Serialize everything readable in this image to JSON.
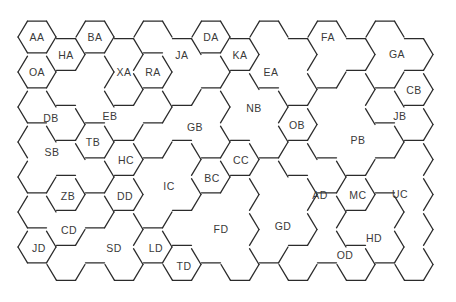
{
  "map": {
    "type": "hexagonal region map",
    "grid": {
      "origin_x": 37,
      "origin_y": 37,
      "col_step": 29,
      "row_step": 35,
      "hex_radius": 19,
      "odd_col_offset": 17.5
    },
    "line_color": "#2b2b2b",
    "cells": [
      [
        "AA",
        "OA",
        "DB",
        "SB",
        "SB",
        "CD",
        "JD"
      ],
      [
        "HA",
        "EB",
        "DB",
        "SB",
        "ZB",
        "CD",
        "SD"
      ],
      [
        "BA",
        "EB",
        "EB",
        "TB",
        "SB",
        "CD",
        "SD"
      ],
      [
        "XA",
        "XA",
        "EB",
        "HC",
        "DD",
        "SD",
        "SD"
      ],
      [
        "JA",
        "RA",
        "EB",
        "GB",
        "IC",
        "IC",
        "LD"
      ],
      [
        "JA",
        "JA",
        "GB",
        "IC",
        "IC",
        "FD",
        "TD"
      ],
      [
        "DA",
        "JA",
        "GB",
        "GB",
        "BC",
        "FD",
        "FD"
      ],
      [
        "KA",
        "NB",
        "NB",
        "CC",
        "FD",
        "FD",
        "FD"
      ],
      [
        "EA",
        "EA",
        "NB",
        "NB",
        "GD",
        "GD",
        "GD"
      ],
      [
        "EA",
        "EA",
        "OB",
        "AD",
        "GD",
        "GD",
        "OD"
      ],
      [
        "FA",
        "FA",
        "PB",
        "PB",
        "AD",
        "OD",
        "OD"
      ],
      [
        "FA",
        "PB",
        "PB",
        "PB",
        "MC",
        "HD",
        "OD"
      ],
      [
        "GA",
        "GA",
        "JB",
        "PB",
        "UC",
        "HD",
        "HD"
      ],
      [
        "GA",
        "CB",
        "JB",
        "UC",
        "UC",
        "UC",
        "UC"
      ]
    ],
    "regions": [
      {
        "id": "AA",
        "label": "AA",
        "x": 37,
        "y": 37
      },
      {
        "id": "HA",
        "label": "HA",
        "x": 66,
        "y": 55
      },
      {
        "id": "BA",
        "label": "BA",
        "x": 95,
        "y": 37
      },
      {
        "id": "OA",
        "label": "OA",
        "x": 37,
        "y": 72
      },
      {
        "id": "XA",
        "label": "XA",
        "x": 124,
        "y": 72
      },
      {
        "id": "RA",
        "label": "RA",
        "x": 153,
        "y": 72
      },
      {
        "id": "JA",
        "label": "JA",
        "x": 182,
        "y": 55
      },
      {
        "id": "DA",
        "label": "DA",
        "x": 211,
        "y": 37
      },
      {
        "id": "KA",
        "label": "KA",
        "x": 240,
        "y": 55
      },
      {
        "id": "EA",
        "label": "EA",
        "x": 271,
        "y": 72
      },
      {
        "id": "FA",
        "label": "FA",
        "x": 328,
        "y": 37
      },
      {
        "id": "GA",
        "label": "GA",
        "x": 397,
        "y": 54
      },
      {
        "id": "CB",
        "label": "CB",
        "x": 414,
        "y": 90
      },
      {
        "id": "JB",
        "label": "JB",
        "x": 400,
        "y": 116
      },
      {
        "id": "DB",
        "label": "DB",
        "x": 51,
        "y": 118
      },
      {
        "id": "EB",
        "label": "EB",
        "x": 110,
        "y": 116
      },
      {
        "id": "GB",
        "label": "GB",
        "x": 195,
        "y": 127
      },
      {
        "id": "NB",
        "label": "NB",
        "x": 254,
        "y": 108
      },
      {
        "id": "OB",
        "label": "OB",
        "x": 297,
        "y": 125
      },
      {
        "id": "PB",
        "label": "PB",
        "x": 358,
        "y": 140
      },
      {
        "id": "SB",
        "label": "SB",
        "x": 52,
        "y": 152
      },
      {
        "id": "TB",
        "label": "TB",
        "x": 93,
        "y": 142
      },
      {
        "id": "HC",
        "label": "HC",
        "x": 126,
        "y": 160
      },
      {
        "id": "CC",
        "label": "CC",
        "x": 241,
        "y": 160
      },
      {
        "id": "BC",
        "label": "BC",
        "x": 212,
        "y": 178
      },
      {
        "id": "IC",
        "label": "IC",
        "x": 169,
        "y": 186
      },
      {
        "id": "ZB",
        "label": "ZB",
        "x": 68,
        "y": 196
      },
      {
        "id": "DD",
        "label": "DD",
        "x": 125,
        "y": 196
      },
      {
        "id": "AD",
        "label": "AD",
        "x": 320,
        "y": 195
      },
      {
        "id": "MC",
        "label": "MC",
        "x": 358,
        "y": 195
      },
      {
        "id": "UC",
        "label": "UC",
        "x": 400,
        "y": 194
      },
      {
        "id": "GD",
        "label": "GD",
        "x": 283,
        "y": 226
      },
      {
        "id": "FD",
        "label": "FD",
        "x": 221,
        "y": 229
      },
      {
        "id": "CD",
        "label": "CD",
        "x": 69,
        "y": 230
      },
      {
        "id": "HD",
        "label": "HD",
        "x": 374,
        "y": 238
      },
      {
        "id": "OD",
        "label": "OD",
        "x": 345,
        "y": 255
      },
      {
        "id": "JD",
        "label": "JD",
        "x": 39,
        "y": 248
      },
      {
        "id": "SD",
        "label": "SD",
        "x": 114,
        "y": 248
      },
      {
        "id": "LD",
        "label": "LD",
        "x": 156,
        "y": 248
      },
      {
        "id": "TD",
        "label": "TD",
        "x": 184,
        "y": 266
      }
    ]
  }
}
